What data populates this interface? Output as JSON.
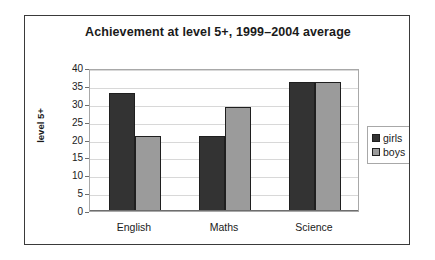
{
  "chart_data": {
    "type": "bar",
    "title": "Achievement at level 5+, 1999–2004 average",
    "xlabel": "",
    "ylabel": "level 5+",
    "categories": [
      "English",
      "Maths",
      "Science"
    ],
    "series": [
      {
        "name": "girls",
        "color": "#333333",
        "values": [
          33,
          21,
          36
        ]
      },
      {
        "name": "boys",
        "color": "#9b9b9b",
        "values": [
          21,
          29,
          36
        ]
      }
    ],
    "ylim": [
      0,
      40
    ],
    "ytick_step": 5,
    "yticks": [
      40,
      35,
      30,
      25,
      20,
      15,
      10,
      5,
      0
    ],
    "ytick_labels": [
      "40",
      "35",
      "30",
      "25",
      "20",
      "15",
      "10",
      "5",
      "0"
    ],
    "grid": true,
    "grid_axis": "y",
    "legend_position": "right",
    "legend_entries": [
      {
        "label": "girls",
        "swatch": "#333333"
      },
      {
        "label": "boys",
        "swatch": "#9b9b9b"
      }
    ],
    "bar_layout": "grouped-adjacent",
    "frame": true
  }
}
